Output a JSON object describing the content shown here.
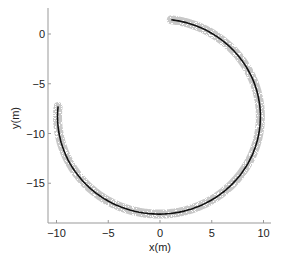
{
  "chart_data": {
    "type": "line",
    "title": "",
    "xlabel": "x(m)",
    "ylabel": "y(m)",
    "xlim": [
      -10.5,
      10.5
    ],
    "ylim": [
      -18.9,
      2.6
    ],
    "xticks": [
      -10,
      -5,
      0,
      5,
      10
    ],
    "yticks": [
      -15,
      -10,
      -5,
      0
    ],
    "xtick_labels": [
      "−10",
      "−5",
      "0",
      "5",
      "10"
    ],
    "ytick_labels": [
      "−15",
      "−10",
      "−5",
      "0"
    ],
    "grid": false,
    "legend": null,
    "series": [
      {
        "name": "trajectory",
        "style": "solid black line",
        "color": "#111111",
        "description": "Near-circular arc, center approx (-0.1, -8.3), radius approx 9.8 m; starts near (1.1, 1.4), runs clockwise through (9.6, -8), (0, -18), ends near (-9.9, -7.3)",
        "x": [
          1.1,
          2.9,
          4.6,
          6.1,
          7.4,
          8.4,
          9.2,
          9.6,
          9.6,
          9.2,
          8.4,
          7.3,
          5.9,
          4.3,
          2.5,
          0.6,
          -1.3,
          -3.1,
          -4.8,
          -6.3,
          -7.6,
          -8.6,
          -9.3,
          -9.7,
          -9.9
        ],
        "y": [
          1.4,
          1.0,
          0.1,
          -1.1,
          -2.6,
          -4.2,
          -6.0,
          -7.9,
          -9.8,
          -11.6,
          -13.3,
          -14.8,
          -16.1,
          -17.1,
          -17.8,
          -18.1,
          -18.1,
          -17.7,
          -16.9,
          -15.8,
          -14.4,
          -12.8,
          -11.0,
          -9.1,
          -7.3
        ]
      },
      {
        "name": "scatter band",
        "style": "grey noisy markers around trajectory",
        "color": "#b0b0b0",
        "description": "Dense light-grey scattered points forming a band ~0.5 m wide around the black trajectory"
      }
    ]
  }
}
